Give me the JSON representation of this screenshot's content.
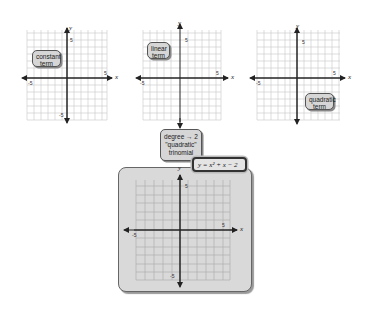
{
  "graphs": [
    {
      "id": "constant",
      "callout": [
        "constant",
        "term"
      ],
      "tick_pos": "5",
      "tick_neg": "-5",
      "x_label": "x",
      "y_label": "y"
    },
    {
      "id": "linear",
      "callout": [
        "linear",
        "term"
      ],
      "tick_pos": "5",
      "tick_neg": "-5",
      "x_label": "x",
      "y_label": "y"
    },
    {
      "id": "quadratic",
      "callout": [
        "quadratic",
        "term"
      ],
      "tick_pos": "5",
      "tick_neg": "-5",
      "x_label": "x",
      "y_label": "y"
    }
  ],
  "degree_callout": {
    "line1": "degree → 2",
    "line2": "\"quadratic\"",
    "line3": "trinomial"
  },
  "equation": "y = x² + x − 2",
  "result_graph": {
    "tick_pos": "5",
    "tick_neg": "-5",
    "x_label": "x",
    "y_label": "y"
  },
  "colors": {
    "grid": "#c8c8c8",
    "axis": "#222222",
    "panel": "#d9d9d9",
    "callout": "#d6d6d6"
  }
}
